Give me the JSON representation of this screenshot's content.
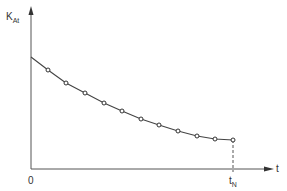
{
  "chart_data": {
    "type": "line",
    "title": "",
    "xlabel": "t",
    "ylabel": "K_At",
    "ylabel_main": "K",
    "ylabel_sub": "At",
    "x_tick_labels": [
      "0",
      "t_N"
    ],
    "x_tick_origin": "0",
    "x_tick_end_main": "t",
    "x_tick_end_sub": "N",
    "grid": false,
    "legend": null,
    "annotations": [
      "dashed vertical line from last point down to t_N"
    ],
    "series": [
      {
        "name": "K_At",
        "line_start": {
          "x": 0,
          "y": 112
        },
        "x": [
          17,
          35,
          54,
          73,
          91,
          110,
          128,
          147,
          166,
          184,
          202
        ],
        "y": [
          99,
          86,
          76,
          66,
          58,
          50,
          44,
          38,
          33,
          30,
          29
        ],
        "markers": "open circles"
      }
    ],
    "xlim": [
      0,
      241
    ],
    "ylim": [
      0,
      161
    ],
    "note": "Values in relative pixel units (no numeric axis scale shown)"
  }
}
